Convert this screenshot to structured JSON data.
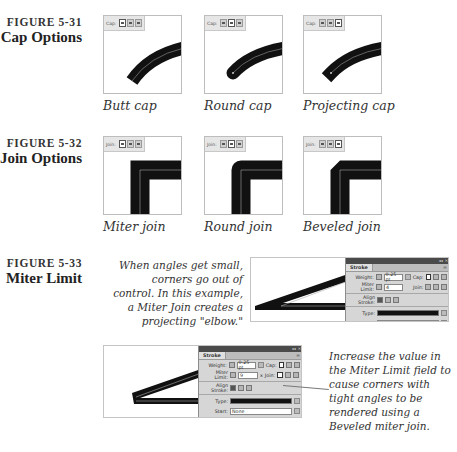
{
  "figures": [
    {
      "number": "FIGURE 5-31",
      "title": "Cap Options",
      "toolbar_label": "Cap:",
      "panels": [
        {
          "caption": "Butt cap",
          "selected_button": 0
        },
        {
          "caption": "Round cap",
          "selected_button": 1
        },
        {
          "caption": "Projecting cap",
          "selected_button": 2
        }
      ]
    },
    {
      "number": "FIGURE 5-32",
      "title": "Join Options",
      "toolbar_label": "Join:",
      "panels": [
        {
          "caption": "Miter join",
          "selected_button": 0
        },
        {
          "caption": "Round join",
          "selected_button": 1
        },
        {
          "caption": "Beveled join",
          "selected_button": 2
        }
      ]
    },
    {
      "number": "FIGURE 5-33",
      "title": "Miter Limit",
      "text_top": "When angles get small, corners go out of control. In this example, a Miter Join creates a projecting \"elbow.\"",
      "text_bottom": "Increase the value in the Miter Limit field to cause corners with tight angles to be rendered using a Beveled miter join."
    }
  ],
  "stroke_panel_top": {
    "title": "Stroke",
    "weight_label": "Weight:",
    "weight_value": "0.25 pt",
    "cap_label": "Cap:",
    "miter_label": "Miter Limit:",
    "miter_value": "4",
    "join_label": "Join:",
    "align_label": "Align Stroke:",
    "type_label": "Type:",
    "start_label": "Start:",
    "start_value": "None"
  },
  "stroke_panel_bottom": {
    "title": "Stroke",
    "weight_label": "Weight:",
    "weight_value": "0.25 pt",
    "cap_label": "Cap:",
    "miter_label": "Miter Limit:",
    "miter_value": "9",
    "miter_suffix": "x",
    "join_label": "Join:",
    "align_label": "Align Stroke:",
    "type_label": "Type:",
    "start_label": "Start:",
    "start_value": "None"
  }
}
